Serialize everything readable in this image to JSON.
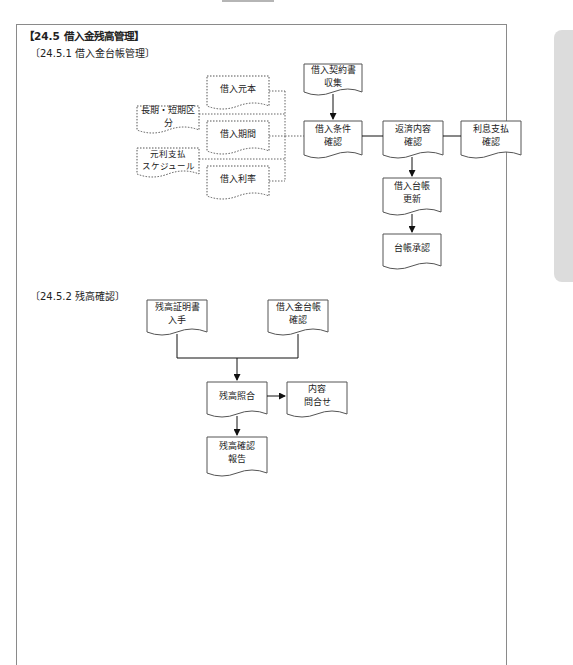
{
  "section": {
    "title": "【24.5  借入金残高管理】",
    "sub1": "〔24.5.1  借入金台帳管理〕",
    "sub2": "〔24.5.2  残高確認〕"
  },
  "diagram1": {
    "inputs": [
      {
        "id": "principal",
        "label": "借入元本"
      },
      {
        "id": "term-class",
        "label": "長期・短期区分"
      },
      {
        "id": "period",
        "label": "借入期間"
      },
      {
        "id": "repay-schedule",
        "label": "元利支払\nスケジュール"
      },
      {
        "id": "rate",
        "label": "借入利率"
      }
    ],
    "process": [
      {
        "id": "contract-collect",
        "label": "借入契約書\n収集"
      },
      {
        "id": "terms-check",
        "label": "借入条件\n確認"
      },
      {
        "id": "repay-check",
        "label": "返済内容\n確認"
      },
      {
        "id": "interest-check",
        "label": "利息支払\n確認"
      },
      {
        "id": "ledger-update",
        "label": "借入台帳\n更新"
      },
      {
        "id": "ledger-approve",
        "label": "台帳承認"
      }
    ]
  },
  "diagram2": {
    "nodes": [
      {
        "id": "cert-obtain",
        "label": "残高証明書\n入手"
      },
      {
        "id": "ledger-check",
        "label": "借入金台帳\n確認"
      },
      {
        "id": "balance-match",
        "label": "残高照合"
      },
      {
        "id": "inquiry",
        "label": "内容\n問合せ"
      },
      {
        "id": "balance-report",
        "label": "残高確認\n報告"
      }
    ]
  }
}
